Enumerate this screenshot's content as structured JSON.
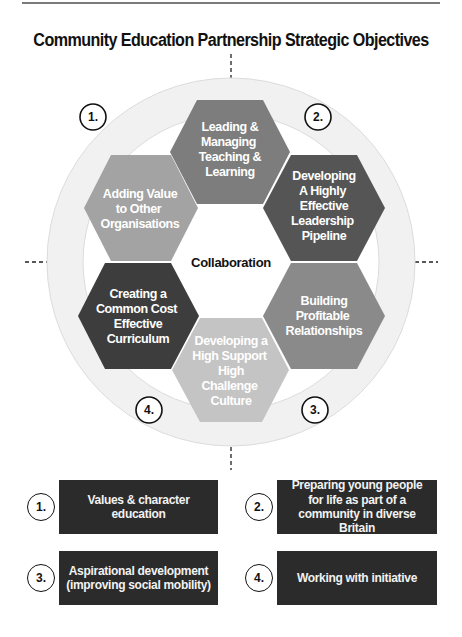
{
  "title": "Community Education Partnership Strategic Objectives",
  "diagram": {
    "center_label": "Collaboration",
    "ring_color": "#f1f1f1",
    "hexagons": [
      {
        "position": "top",
        "lines": [
          "Leading &",
          "Managing",
          "Teaching &",
          "Learning"
        ],
        "color": "#7d7d7d"
      },
      {
        "position": "upper-right",
        "lines": [
          "Developing",
          "A Highly",
          "Effective",
          "Leadership",
          "Pipeline"
        ],
        "color": "#555555"
      },
      {
        "position": "lower-right",
        "lines": [
          "Building",
          "Profitable",
          "Relationships"
        ],
        "color": "#8a8a8a"
      },
      {
        "position": "bottom",
        "lines": [
          "Developing a",
          "High Support",
          "High",
          "Challenge",
          "Culture"
        ],
        "color": "#c4c4c4"
      },
      {
        "position": "lower-left",
        "lines": [
          "Creating a",
          "Common Cost",
          "Effective",
          "Curriculum"
        ],
        "color": "#3d3d3d"
      },
      {
        "position": "upper-left",
        "lines": [
          "Adding Value",
          "to Other",
          "Organisations"
        ],
        "color": "#a3a3a3"
      }
    ],
    "ring_markers": [
      {
        "label": "1.",
        "position": "top-left"
      },
      {
        "label": "2.",
        "position": "top-right"
      },
      {
        "label": "3.",
        "position": "bottom-right"
      },
      {
        "label": "4.",
        "position": "bottom-left"
      }
    ]
  },
  "legend": [
    {
      "number": "1.",
      "text": "Values & character education"
    },
    {
      "number": "2.",
      "text": "Preparing young people for life as part of a community in diverse Britain"
    },
    {
      "number": "3.",
      "text": "Aspirational development (improving social mobility)"
    },
    {
      "number": "4.",
      "text": "Working with initiative"
    }
  ],
  "legend_box_color": "#2b2b2b"
}
